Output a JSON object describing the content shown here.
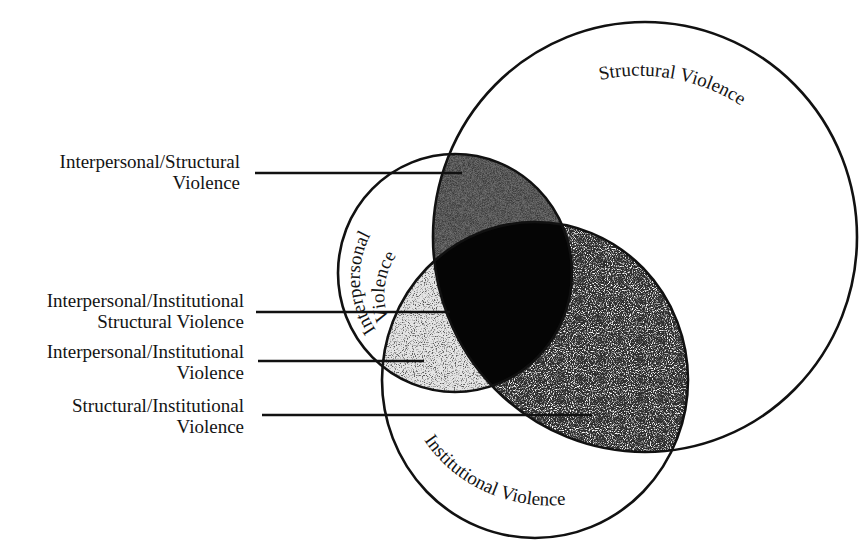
{
  "diagram": {
    "type": "venn-3",
    "circles": [
      {
        "id": "structural",
        "label": "Structural Violence",
        "cx": 645,
        "cy": 237,
        "rx": 212,
        "ry": 215
      },
      {
        "id": "interpersonal",
        "label_line1": "Interpersonal",
        "label_line2": "Violence",
        "cx": 455,
        "cy": 273,
        "rx": 117,
        "ry": 119
      },
      {
        "id": "institutional",
        "label": "Institutional Violence",
        "cx": 535,
        "cy": 380,
        "rx": 153,
        "ry": 158
      }
    ],
    "regions": [
      {
        "id": "interpersonal-structural",
        "fill": "#6a6a6a",
        "texture": "fine-crosshatch"
      },
      {
        "id": "interpersonal-institutional",
        "fill": "#d8d8d8",
        "texture": "light-stipple"
      },
      {
        "id": "structural-institutional",
        "fill": "#3c3c3c",
        "texture": "coarse-stipple"
      },
      {
        "id": "all-three",
        "fill": "#050505",
        "texture": "solid"
      }
    ],
    "callouts": [
      {
        "line1": "Interpersonal/Structural",
        "line2": "Violence",
        "target": "interpersonal-structural"
      },
      {
        "line1": "Interpersonal/Institutional",
        "line2": "Structural Violence",
        "target": "all-three"
      },
      {
        "line1": "Interpersonal/Institutional",
        "line2": "Violence",
        "target": "interpersonal-institutional"
      },
      {
        "line1": "Structural/Institutional",
        "line2": "Violence",
        "target": "structural-institutional"
      }
    ],
    "colors": {
      "stroke": "#111111",
      "background": "#ffffff"
    }
  }
}
